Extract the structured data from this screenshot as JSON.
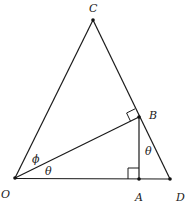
{
  "diagram": {
    "points": {
      "C": {
        "label": "C",
        "x": 93,
        "y": 20
      },
      "B": {
        "label": "B",
        "x": 139,
        "y": 117
      },
      "O": {
        "label": "O",
        "x": 15,
        "y": 178
      },
      "A": {
        "label": "A",
        "x": 139,
        "y": 179
      },
      "D": {
        "label": "D",
        "x": 170,
        "y": 179
      }
    },
    "segments": [
      "OC",
      "CD",
      "OD",
      "OB",
      "AB"
    ],
    "right_angles": [
      "OBC",
      "OAB"
    ],
    "angles": {
      "phi": {
        "label": "ϕ",
        "at": "O",
        "between": "OB-OC"
      },
      "theta_O": {
        "label": "θ",
        "at": "O",
        "between": "OD-OB"
      },
      "theta_B": {
        "label": "θ",
        "at": "B",
        "between": "BA-BD"
      }
    },
    "stroke_color": "#1a1a1a"
  }
}
